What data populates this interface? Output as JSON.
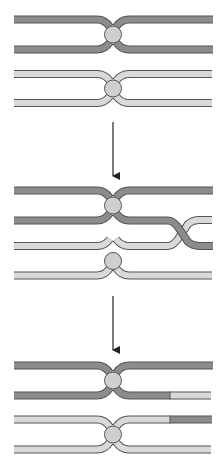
{
  "diagram": {
    "colors": {
      "dark_chromatid": "#8c8c8c",
      "light_chromatid": "#d9d9d9",
      "outline": "#555555",
      "centromere": "#cfcfcf",
      "arrow": "#222222"
    },
    "stages": [
      {
        "name": "paired-homologs",
        "description": "Two homologous chromosomes aligned"
      },
      {
        "name": "crossing-over",
        "description": "Non-sister chromatids cross over"
      },
      {
        "name": "recombinant",
        "description": "Exchanged segments at chromatid ends"
      }
    ],
    "arrows": [
      {
        "from": "paired-homologs",
        "to": "crossing-over"
      },
      {
        "from": "crossing-over",
        "to": "recombinant"
      }
    ]
  }
}
